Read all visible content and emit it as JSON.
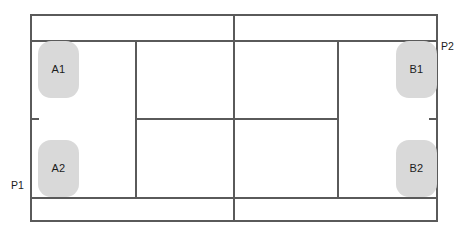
{
  "diagram": {
    "colors": {
      "line": "#5a5a5a",
      "player_fill": "#d9d9d9",
      "text": "#1c1c1c",
      "background": "#ffffff"
    },
    "court": {
      "orientation": "horizontal",
      "type": "doubles",
      "outline": {
        "x": 30,
        "y": 14,
        "width": 408,
        "height": 208
      },
      "lines": [
        {
          "name": "top-doubles-sideline",
          "orientation": "horizontal",
          "x": 30,
          "y": 40,
          "length": 408
        },
        {
          "name": "bottom-doubles-sideline",
          "orientation": "horizontal",
          "x": 30,
          "y": 197,
          "length": 408
        },
        {
          "name": "net",
          "orientation": "vertical",
          "x": 234,
          "y": 14,
          "length": 208
        },
        {
          "name": "left-service-line",
          "orientation": "vertical",
          "x": 135,
          "y": 40,
          "length": 159
        },
        {
          "name": "right-service-line",
          "orientation": "vertical",
          "x": 337,
          "y": 40,
          "length": 159
        },
        {
          "name": "center-service-line",
          "orientation": "horizontal",
          "x": 135,
          "y": 118,
          "length": 204
        },
        {
          "name": "left-baseline-center-mark",
          "orientation": "horizontal",
          "x": 30,
          "y": 118,
          "length": 9
        },
        {
          "name": "right-baseline-center-mark",
          "orientation": "horizontal",
          "x": 429,
          "y": 118,
          "length": 9
        }
      ]
    },
    "players": [
      {
        "id": "A1",
        "label": "A1",
        "team": "A",
        "side": "left",
        "half": "top",
        "x": 38,
        "y": 41
      },
      {
        "id": "A2",
        "label": "A2",
        "team": "A",
        "side": "left",
        "half": "bottom",
        "x": 38,
        "y": 140
      },
      {
        "id": "B1",
        "label": "B1",
        "team": "B",
        "side": "right",
        "half": "top",
        "x": 396,
        "y": 41
      },
      {
        "id": "B2",
        "label": "B2",
        "team": "B",
        "side": "right",
        "half": "bottom",
        "x": 396,
        "y": 140
      }
    ],
    "endpoints": [
      {
        "id": "P1",
        "label": "P1",
        "x": 11,
        "y": 180
      },
      {
        "id": "P2",
        "label": "P2",
        "x": 441,
        "y": 41
      }
    ]
  }
}
